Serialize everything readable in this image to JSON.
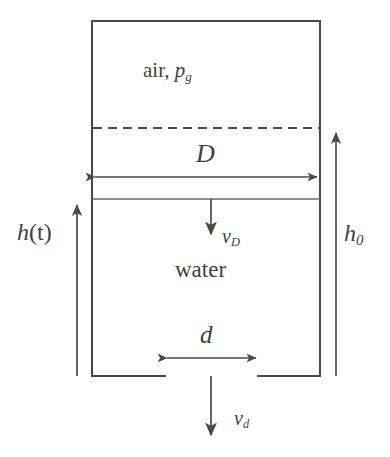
{
  "figure": {
    "background_color": "#ffffff",
    "line_color": "#4a4a4a",
    "text_color": "#3f3f3f"
  },
  "labels": {
    "air": "air,",
    "air_pressure_symbol": "p",
    "air_pressure_subscript": "g",
    "tank_diameter": "D",
    "orifice_diameter": "d",
    "water": "water",
    "height_time_symbol": "h",
    "height_time_arg": "(t)",
    "initial_height_symbol": "h",
    "initial_height_subscript": "0",
    "velocity_tank_symbol": "v",
    "velocity_tank_subscript": "D",
    "velocity_orifice_symbol": "v",
    "velocity_orifice_subscript": "d"
  },
  "geometry": {
    "tank_left_x": 92,
    "tank_right_x": 320,
    "tank_top_y": 21,
    "tank_bottom_y": 376,
    "water_surface_y": 199,
    "initial_level_y": 128,
    "orifice_left_x": 165,
    "orifice_right_x": 258,
    "centerline_x": 211,
    "h_arrow_x": 77,
    "h0_arrow_x": 336,
    "D_dim_y": 177,
    "d_dim_y": 358,
    "vD_arrow_top_y": 199,
    "vD_arrow_bottom_y": 238,
    "vd_arrow_top_y": 376,
    "vd_arrow_bottom_y": 440
  },
  "annotations": [
    {
      "name": "tank-outline",
      "kind": "rectangle-open-bottom"
    },
    {
      "name": "initial-level-line",
      "kind": "dashed-horizontal"
    },
    {
      "name": "water-surface-line",
      "kind": "solid-horizontal"
    },
    {
      "name": "tank-diameter-dimension",
      "kind": "double-headed-arrow",
      "label": "D"
    },
    {
      "name": "orifice-diameter-dimension",
      "kind": "double-headed-arrow",
      "label": "d"
    },
    {
      "name": "current-height-arrow",
      "kind": "single-headed-arrow-up",
      "label": "h(t)"
    },
    {
      "name": "initial-height-arrow",
      "kind": "single-headed-arrow-up",
      "label": "h0"
    },
    {
      "name": "surface-velocity-arrow",
      "kind": "single-headed-arrow-down",
      "label": "vD"
    },
    {
      "name": "jet-velocity-arrow",
      "kind": "single-headed-arrow-down",
      "label": "vd"
    }
  ]
}
